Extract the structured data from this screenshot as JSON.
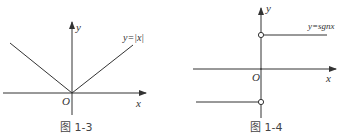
{
  "figures": [
    {
      "id": "fig-1-3",
      "caption": "图 1-3",
      "function_label": "y=|x|",
      "axis_x_label": "x",
      "axis_y_label": "y",
      "origin_label": "O"
    },
    {
      "id": "fig-1-4",
      "caption": "图 1-4",
      "function_label": "y=sgnx",
      "axis_x_label": "x",
      "axis_y_label": "y",
      "origin_label": "O"
    }
  ],
  "colors": {
    "stroke": "#333333",
    "background": "#ffffff"
  }
}
